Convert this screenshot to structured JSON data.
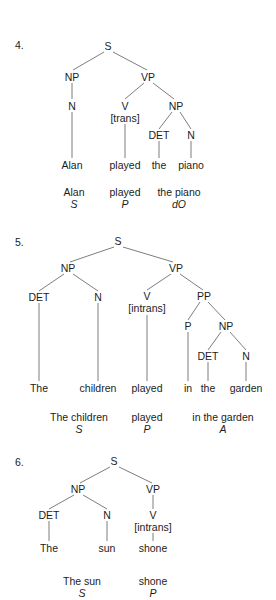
{
  "page": {
    "background_color": "#ffffff",
    "text_color": "#1c1c1c",
    "line_color": "#6e6e6e",
    "width": 276,
    "height": 600
  },
  "exercises": [
    {
      "number": "4.",
      "sentence": "Alan played the piano",
      "tree_nodes": {
        "s": "S",
        "np_subject": "NP",
        "n_subject": "N",
        "vp": "VP",
        "v": "V",
        "v_feature": "[trans]",
        "np_object": "NP",
        "det_object": "DET",
        "n_object": "N"
      },
      "leaves": [
        "Alan",
        "played",
        "the",
        "piano"
      ],
      "summary_words": [
        "Alan",
        "played",
        "the piano"
      ],
      "summary_functions": [
        "S",
        "P",
        "dO"
      ]
    },
    {
      "number": "5.",
      "sentence": "The children played in the garden",
      "tree_nodes": {
        "s": "S",
        "np_subject": "NP",
        "det_subject": "DET",
        "n_subject": "N",
        "vp": "VP",
        "v": "V",
        "v_feature": "[intrans]",
        "pp": "PP",
        "p": "P",
        "np_prep": "NP",
        "det_prep": "DET",
        "n_prep": "N"
      },
      "leaves": [
        "The",
        "children",
        "played",
        "in",
        "the",
        "garden"
      ],
      "summary_words": [
        "The children",
        "played",
        "in the garden"
      ],
      "summary_functions": [
        "S",
        "P",
        "A"
      ]
    },
    {
      "number": "6.",
      "sentence": "The sun shone",
      "tree_nodes": {
        "s": "S",
        "np_subject": "NP",
        "det_subject": "DET",
        "n_subject": "N",
        "vp": "VP",
        "v": "V",
        "v_feature": "[intrans]"
      },
      "leaves": [
        "The",
        "sun",
        "shone"
      ],
      "summary_words": [
        "The sun",
        "shone"
      ],
      "summary_functions": [
        "S",
        "P"
      ]
    }
  ]
}
